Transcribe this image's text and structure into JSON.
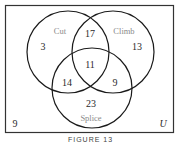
{
  "diagram": {
    "type": "venn",
    "universe_label": "U",
    "sets": [
      {
        "name": "Cut",
        "cx": 68,
        "cy": 52,
        "r": 41,
        "label_x": 60,
        "label_y": 32
      },
      {
        "name": "Climb",
        "cx": 113,
        "cy": 52,
        "r": 41,
        "label_x": 124,
        "label_y": 32
      },
      {
        "name": "Splice",
        "cx": 92,
        "cy": 88,
        "r": 40,
        "label_x": 91,
        "label_y": 120
      }
    ],
    "regions": [
      {
        "id": "cut-only",
        "value": "3",
        "x": 43,
        "y": 50
      },
      {
        "id": "climb-only",
        "value": "13",
        "x": 137,
        "y": 51
      },
      {
        "id": "splice-only",
        "value": "23",
        "x": 91,
        "y": 108
      },
      {
        "id": "cut-climb",
        "value": "17",
        "x": 90,
        "y": 37
      },
      {
        "id": "cut-splice",
        "value": "14",
        "x": 67,
        "y": 86
      },
      {
        "id": "climb-splice",
        "value": "9",
        "x": 115,
        "y": 86
      },
      {
        "id": "cut-climb-splice",
        "value": "11",
        "x": 90,
        "y": 69
      },
      {
        "id": "outside",
        "value": "9",
        "x": 15,
        "y": 127
      }
    ],
    "caption": "FIGURE 13",
    "colors": {
      "stroke": "#1a1a1a",
      "set_label": "#8a8a8a",
      "number": "#2a2a2a",
      "frame": "#333333"
    }
  }
}
